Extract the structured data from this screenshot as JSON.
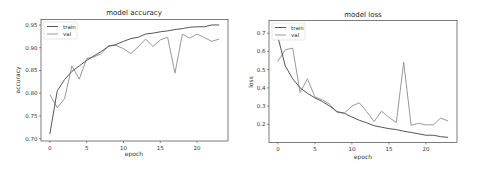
{
  "chart_data": [
    {
      "type": "line",
      "title": "model accuracy",
      "xlabel": "epoch",
      "ylabel": "accuracy",
      "xlim": [
        -1.2,
        24.2
      ],
      "ylim": [
        0.695,
        0.962
      ],
      "xticks": [
        0,
        5,
        10,
        15,
        20
      ],
      "xtick_labels": [
        "0",
        "5",
        "10",
        "15",
        "20"
      ],
      "yticks": [
        0.7,
        0.75,
        0.8,
        0.85,
        0.9,
        0.95
      ],
      "ytick_labels": [
        "0.70",
        "0.75",
        "0.80",
        "0.85",
        "0.90",
        "0.95"
      ],
      "grid": false,
      "legend_position": "upper left",
      "x": [
        0,
        1,
        2,
        3,
        4,
        5,
        6,
        7,
        8,
        9,
        10,
        11,
        12,
        13,
        14,
        15,
        16,
        17,
        18,
        19,
        20,
        21,
        22,
        23
      ],
      "series": [
        {
          "name": "train",
          "color": "#555555",
          "values": [
            0.71,
            0.805,
            0.83,
            0.848,
            0.86,
            0.872,
            0.882,
            0.892,
            0.903,
            0.907,
            0.914,
            0.92,
            0.923,
            0.93,
            0.932,
            0.935,
            0.937,
            0.94,
            0.942,
            0.945,
            0.946,
            0.946,
            0.95,
            0.95
          ]
        },
        {
          "name": "val",
          "color": "#999999",
          "values": [
            0.797,
            0.768,
            0.788,
            0.86,
            0.831,
            0.876,
            0.88,
            0.887,
            0.905,
            0.905,
            0.898,
            0.887,
            0.902,
            0.919,
            0.903,
            0.917,
            0.923,
            0.844,
            0.93,
            0.921,
            0.93,
            0.922,
            0.914,
            0.919
          ]
        }
      ]
    },
    {
      "type": "line",
      "title": "model loss",
      "xlabel": "epoch",
      "ylabel": "loss",
      "xlim": [
        -1.2,
        24.2
      ],
      "ylim": [
        0.1,
        0.77
      ],
      "xticks": [
        0,
        5,
        10,
        15,
        20
      ],
      "xtick_labels": [
        "0",
        "5",
        "10",
        "15",
        "20"
      ],
      "yticks": [
        0.2,
        0.3,
        0.4,
        0.5,
        0.6,
        0.7
      ],
      "ytick_labels": [
        "0.2",
        "0.3",
        "0.4",
        "0.5",
        "0.6",
        "0.7"
      ],
      "grid": false,
      "legend_position": "upper left",
      "x": [
        0,
        1,
        2,
        3,
        4,
        5,
        6,
        7,
        8,
        9,
        10,
        11,
        12,
        13,
        14,
        15,
        16,
        17,
        18,
        19,
        20,
        21,
        22,
        23
      ],
      "series": [
        {
          "name": "train",
          "color": "#555555",
          "values": [
            0.68,
            0.52,
            0.45,
            0.4,
            0.37,
            0.345,
            0.325,
            0.3,
            0.27,
            0.26,
            0.24,
            0.222,
            0.208,
            0.192,
            0.184,
            0.176,
            0.171,
            0.162,
            0.155,
            0.148,
            0.14,
            0.14,
            0.132,
            0.128
          ]
        },
        {
          "name": "val",
          "color": "#999999",
          "values": [
            0.545,
            0.61,
            0.618,
            0.375,
            0.45,
            0.35,
            0.335,
            0.31,
            0.265,
            0.262,
            0.3,
            0.318,
            0.27,
            0.215,
            0.272,
            0.238,
            0.21,
            0.54,
            0.194,
            0.205,
            0.197,
            0.197,
            0.234,
            0.218
          ]
        }
      ]
    }
  ],
  "legend": {
    "train": "train",
    "val": "val"
  }
}
